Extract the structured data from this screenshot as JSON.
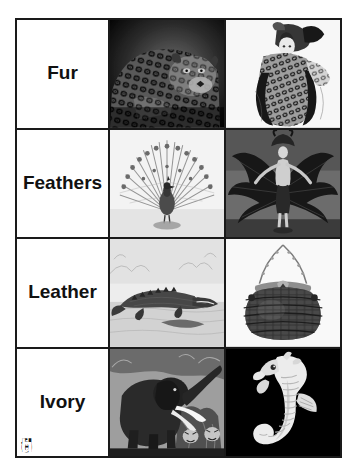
{
  "figure": {
    "type": "photo-grid",
    "columns": 3,
    "rows": 4,
    "caption": "",
    "border_color": "#1a1a1a",
    "background_color": "#ffffff"
  },
  "rows": [
    {
      "label": "Fur",
      "panels": [
        {
          "letter": "a",
          "letter_style": "light",
          "subject": "leopard",
          "description": "Leopard resting, spotted coat, dark background",
          "tone": "dark"
        },
        {
          "letter": "b",
          "letter_style": "dark",
          "subject": "fur-coat-fashion-illustration",
          "description": "Fashion illustration of woman wearing spotted fur garment",
          "tone": "light"
        }
      ]
    },
    {
      "label": "Feathers",
      "panels": [
        {
          "letter": "c",
          "letter_style": "dark",
          "subject": "peacock",
          "description": "Peacock with tail fanned open, engraving on light ground",
          "tone": "light"
        },
        {
          "letter": "d",
          "letter_style": "dark",
          "subject": "feather-costume-dancer",
          "description": "Showgirl in feather headdress and costume with large fanned plumes",
          "tone": "mid"
        }
      ]
    },
    {
      "label": "Leather",
      "panels": [
        {
          "letter": "e",
          "letter_style": "dark",
          "subject": "alligator",
          "description": "Alligator on riverbank, engraving on light ground",
          "tone": "light"
        },
        {
          "letter": "f",
          "letter_style": "dark",
          "subject": "crocodile-leather-handbag",
          "description": "Crocodile skin purse with metal chain handle",
          "tone": "light"
        }
      ]
    },
    {
      "label": "Ivory",
      "panels": [
        {
          "letter": "g",
          "letter_style": "light",
          "subject": "elephant",
          "description": "Elephant with tusks in jungle scene with tigers",
          "tone": "dark"
        },
        {
          "letter": "h",
          "letter_style": "light",
          "subject": "carved-ivory-seahorse",
          "description": "Carved ivory seahorse figurine on black background",
          "tone": "dark"
        }
      ]
    }
  ]
}
